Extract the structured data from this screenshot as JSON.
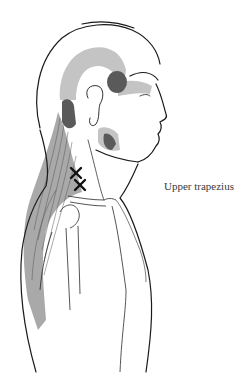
{
  "figure": {
    "caption": "Upper trapezius",
    "trigger_point_count": 2,
    "colors": {
      "outline": "#1a1a1a",
      "referral_primary": "#5a5a5a",
      "referral_secondary": "#c4c4c4",
      "muscle_fill": "#9a9a9a",
      "trigger_mark": "#111111",
      "background": "#ffffff"
    }
  }
}
